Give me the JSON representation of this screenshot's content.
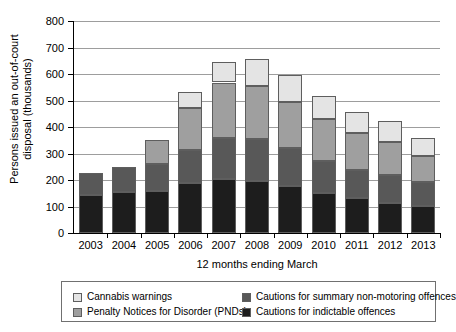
{
  "top_caption": "",
  "chart_data": {
    "type": "bar",
    "stacked": true,
    "title": "",
    "xlabel": "12 months ending March",
    "ylabel": "Persons issued an out-of-court disposal (thousands)",
    "categories": [
      "2003",
      "2004",
      "2005",
      "2006",
      "2007",
      "2008",
      "2009",
      "2010",
      "2011",
      "2012",
      "2013"
    ],
    "ylim": [
      0,
      800
    ],
    "yticks": [
      0,
      100,
      200,
      300,
      400,
      500,
      600,
      700,
      800
    ],
    "grid": true,
    "legend_position": "bottom",
    "series": [
      {
        "name": "Cautions for indictable offences",
        "color": "#1d1d1d",
        "values": [
          145,
          155,
          157,
          190,
          205,
          198,
          177,
          151,
          131,
          115,
          101
        ]
      },
      {
        "name": "Cautions for summary non-motoring offences",
        "color": "#585858",
        "values": [
          80,
          95,
          103,
          123,
          153,
          155,
          145,
          121,
          108,
          105,
          91
        ]
      },
      {
        "name": "Penalty Notices for Disorder (PNDs)",
        "color": "#9f9f9f",
        "values": [
          0,
          0,
          90,
          157,
          210,
          203,
          173,
          160,
          140,
          124,
          98
        ]
      },
      {
        "name": "Cannabis warnings",
        "color": "#e4e4e4",
        "values": [
          0,
          0,
          0,
          62,
          77,
          99,
          103,
          86,
          77,
          79,
          69
        ]
      }
    ],
    "totals": [
      225,
      250,
      350,
      532,
      645,
      655,
      598,
      518,
      456,
      423,
      359
    ]
  },
  "legend": {
    "items": [
      {
        "label": "Cannabis warnings",
        "color": "#e4e4e4"
      },
      {
        "label": "Cautions for summary non-motoring offences",
        "color": "#585858"
      },
      {
        "label": "Penalty Notices for Disorder (PNDs)",
        "color": "#9f9f9f"
      },
      {
        "label": "Cautions for indictable offences",
        "color": "#1d1d1d"
      }
    ]
  }
}
